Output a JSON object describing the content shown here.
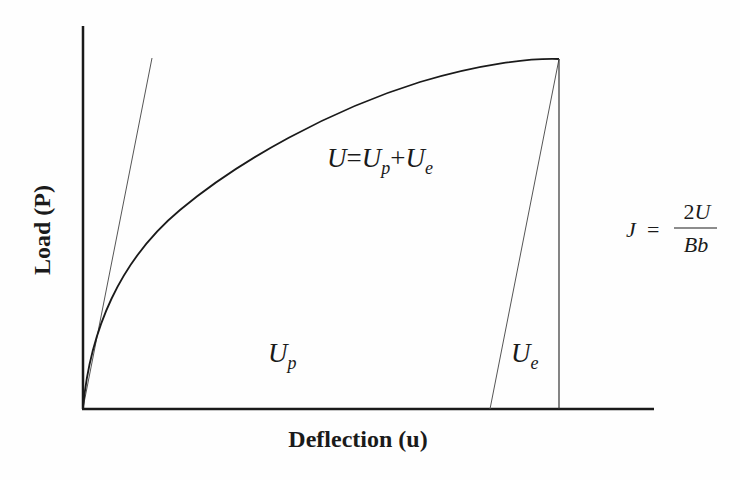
{
  "diagram": {
    "title": "",
    "axes": {
      "x_label": "Deflection (u)",
      "y_label": "Load (P)"
    },
    "curve": {
      "name": "load-deflection curve",
      "color": "#1a1a1a"
    },
    "initial_tangent": {
      "name": "elastic loading line",
      "color": "#555555"
    },
    "unloading_line": {
      "name": "elastic unloading line",
      "color": "#555555"
    },
    "labels": {
      "total_energy": {
        "U": "U",
        "eq": "=",
        "Up_base": "U",
        "Up_sub": "p",
        "plus": "+",
        "Ue_base": "U",
        "Ue_sub": "e"
      },
      "plastic_energy": {
        "base": "U",
        "sub": "p"
      },
      "elastic_energy": {
        "base": "U",
        "sub": "e"
      },
      "j_integral": {
        "lhs": "J",
        "eq": "=",
        "numerator_coef": "2",
        "numerator_var": "U",
        "denominator": "Bb"
      }
    }
  }
}
